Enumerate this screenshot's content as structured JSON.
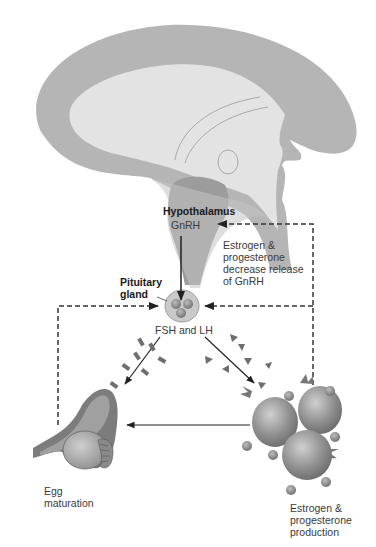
{
  "diagram": {
    "type": "hormone-feedback-loop",
    "labels": {
      "hypothalamus": "Hypothalamus",
      "gnrh": "GnRH",
      "feedback_note": [
        "Estrogen &",
        "progesterone",
        "decrease release",
        "of GnRH"
      ],
      "pituitary": [
        "Pituitary",
        "gland"
      ],
      "fsh_lh": "FSH and LH",
      "egg": [
        "Egg",
        "maturation"
      ],
      "estrogen_production": [
        "Estrogen &",
        "progesterone",
        "production"
      ]
    },
    "nodes": [
      {
        "id": "brain",
        "name": "Brain (sagittal section)"
      },
      {
        "id": "hypothalamus",
        "name": "Hypothalamus",
        "secretes": "GnRH"
      },
      {
        "id": "pituitary",
        "name": "Pituitary gland",
        "secretes": "FSH and LH"
      },
      {
        "id": "ovary",
        "name": "Ovary",
        "effect": "Egg maturation"
      },
      {
        "id": "follicle-cells",
        "name": "Follicle cells",
        "effect": "Estrogen & progesterone production"
      }
    ],
    "edges": [
      {
        "from": "hypothalamus",
        "to": "pituitary",
        "label": "GnRH",
        "style": "solid"
      },
      {
        "from": "pituitary",
        "to": "ovary",
        "label": "FSH and LH",
        "style": "solid"
      },
      {
        "from": "pituitary",
        "to": "follicle-cells",
        "label": "FSH and LH",
        "style": "solid"
      },
      {
        "from": "follicle-cells",
        "to": "ovary",
        "style": "solid"
      },
      {
        "from": "follicle-cells",
        "to": "hypothalamus",
        "label": "Estrogen & progesterone decrease release of GnRH",
        "style": "dashed"
      },
      {
        "from": "follicle-cells",
        "to": "pituitary",
        "style": "dashed"
      },
      {
        "from": "ovary",
        "to": "pituitary",
        "style": "dashed"
      }
    ],
    "colors": {
      "brain_outer": "#b4b4b4",
      "brain_inner": "#e2e2e2",
      "hypothalamus": "#9a9a9a",
      "gland": "#c8c8c8",
      "cells": "#8c8c8c",
      "arrow": "#222222"
    }
  }
}
